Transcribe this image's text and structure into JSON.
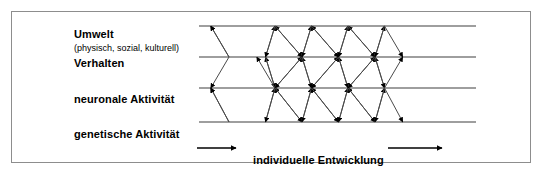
{
  "figure": {
    "type": "conceptual-diagram",
    "title_text_blocks": {
      "level_environment": "Umwelt",
      "level_environment_detail": "(physisch, sozial, kulturell)",
      "level_behavior": "Verhalten",
      "level_neuronal": "neuronale Aktivität",
      "level_genetic": "genetische Aktivität",
      "axis_label": "individuelle Entwicklung"
    },
    "colors": {
      "ink": "#000000",
      "frame": "#8d8d8d",
      "background": "#ffffff",
      "line": "#3a3a3a"
    },
    "levels": [
      {
        "id": "umwelt",
        "label": "Umwelt",
        "sub": "(physisch, sozial, kulturell)",
        "row": 1
      },
      {
        "id": "verhalten",
        "label": "Verhalten",
        "sub": "",
        "row": 2
      },
      {
        "id": "neuronale",
        "label": "neuronale Aktivität",
        "sub": "",
        "row": 3
      },
      {
        "id": "genetische",
        "label": "genetische Aktivität",
        "sub": "",
        "row": 4
      }
    ],
    "lattice": {
      "rows_y": [
        26,
        57,
        88,
        122
      ],
      "x_start": 199,
      "x_end": 476,
      "node_spacing": 36.5,
      "odd_row_first_node_x": 275,
      "even_row_first_node_x": 229,
      "nodes_per_odd_row": 4,
      "nodes_per_even_row": 5,
      "arrowheads": "filled-triangle",
      "direction": "bidirectional-between-adjacent-levels"
    },
    "axis_arrows": {
      "left_arrow_x1": 197,
      "left_arrow_x2": 236,
      "right_arrow_x1": 388,
      "right_arrow_x2": 442,
      "y": 148
    }
  }
}
